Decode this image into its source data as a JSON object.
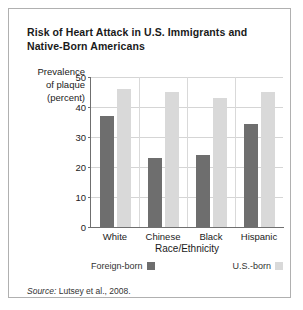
{
  "title": "Risk of Heart Attack in U.S. Immigrants and Native-Born Americans",
  "source": {
    "label": "Source:",
    "text": "Lutsey et al., 2008."
  },
  "ylabel_lines": {
    "l1": "Prevalence",
    "l2": "of plaque",
    "l3": "(percent)"
  },
  "colors": {
    "foreign_born": "#6e6e6e",
    "us_born": "#d9d9d9",
    "axis": "#6f6f6f",
    "grid": "#d5d5d5",
    "border": "#b0b0b0"
  },
  "chart_data": {
    "type": "bar",
    "title": "Risk of Heart Attack in U.S. Immigrants and Native-Born Americans",
    "xlabel": "Race/Ethnicity",
    "ylabel": "Prevalence of plaque (percent)",
    "categories": [
      "White",
      "Chinese",
      "Black",
      "Hispanic"
    ],
    "series": [
      {
        "name": "Foreign-born",
        "values": [
          37,
          23,
          24,
          34.5
        ],
        "color": "#6e6e6e"
      },
      {
        "name": "U.S.-born",
        "values": [
          46,
          45,
          43,
          45
        ],
        "color": "#d9d9d9"
      }
    ],
    "ylim": [
      0,
      50
    ],
    "yticks": [
      0,
      10,
      20,
      30,
      40,
      50
    ],
    "grid": true,
    "legend_position": "bottom"
  }
}
